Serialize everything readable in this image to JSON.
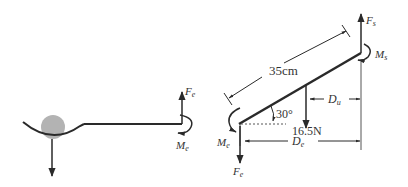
{
  "left_figure": {
    "force_label": "F",
    "force_sub": "e",
    "moment_label": "M",
    "moment_sub": "e"
  },
  "right_figure": {
    "length_label": "35cm",
    "angle_label": "30°",
    "weight_label": "16.5N",
    "shoulder_force_label": "F",
    "shoulder_force_sub": "s",
    "shoulder_moment_label": "M",
    "shoulder_moment_sub": "s",
    "elbow_force_label": "F",
    "elbow_force_sub": "e",
    "elbow_moment_label": "M",
    "elbow_moment_sub": "e",
    "du_label": "D",
    "du_sub": "u",
    "de_label": "D",
    "de_sub": "e"
  },
  "colors": {
    "line": "#2a2a2a",
    "ball": "#b3b3b3",
    "text": "#333333"
  }
}
